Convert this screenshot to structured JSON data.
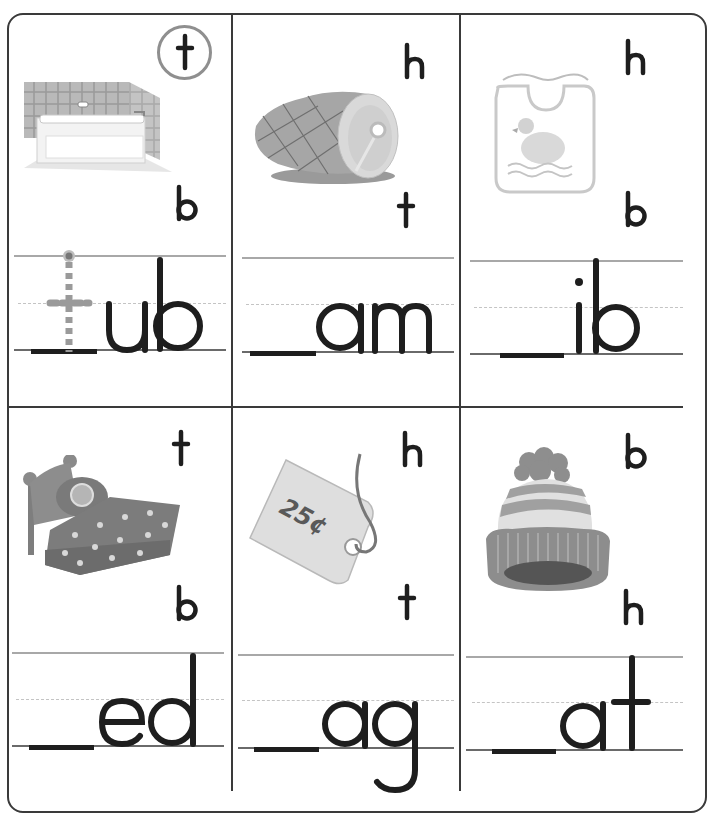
{
  "worksheet": {
    "instructions_visible": false,
    "colors": {
      "ink": "#1e1e1e",
      "border": "#3a3a3a",
      "rule_top": "#a8a8a8",
      "rule_mid": "#c4c4c4",
      "rule_base": "#6a6a6a",
      "trace_guide": "#9a9a9a",
      "circle": "#8f8f8f"
    },
    "cards": [
      {
        "picture": "bathtub-picture",
        "choices": [
          "t",
          "b"
        ],
        "circled": "t",
        "word_ending": "ub",
        "blank": "_",
        "traced_letter": "t"
      },
      {
        "picture": "ham-picture",
        "choices": [
          "h",
          "t"
        ],
        "circled": null,
        "word_ending": "am",
        "blank": "_"
      },
      {
        "picture": "bib-picture",
        "choices": [
          "h",
          "b"
        ],
        "circled": null,
        "word_ending": "ib",
        "blank": "_"
      },
      {
        "picture": "bed-picture",
        "choices": [
          "t",
          "b"
        ],
        "circled": null,
        "word_ending": "ed",
        "blank": "_"
      },
      {
        "picture": "price-tag-picture",
        "price_label": "25¢",
        "choices": [
          "h",
          "t"
        ],
        "circled": null,
        "word_ending": "ag",
        "blank": "_"
      },
      {
        "picture": "hat-picture",
        "choices": [
          "b",
          "h"
        ],
        "circled": null,
        "word_ending": "at",
        "blank": "_"
      }
    ]
  }
}
